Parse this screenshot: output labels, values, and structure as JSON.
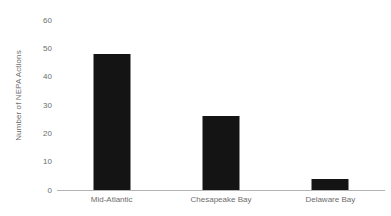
{
  "chart_data": {
    "type": "bar",
    "title": "",
    "subtitle": "",
    "xlabel": "",
    "ylabel": "Number of NEPA Actions",
    "categories": [
      "Mid-Atlantic",
      "Chesapeake Bay",
      "Delaware Bay"
    ],
    "values": [
      48,
      26,
      4
    ],
    "ylim": [
      0,
      60
    ],
    "ytick_labels": [
      "0",
      "10",
      "20",
      "30",
      "40",
      "50",
      "60"
    ],
    "ytick_values": [
      0,
      10,
      20,
      30,
      40,
      50,
      60
    ],
    "grid": false,
    "legend": null,
    "legend_position": "none",
    "annotations": [],
    "bar_color": "#141414",
    "axis_color": "#b3b3b3",
    "text_color": "#6d6d6d",
    "background_color": "#ffffff"
  }
}
